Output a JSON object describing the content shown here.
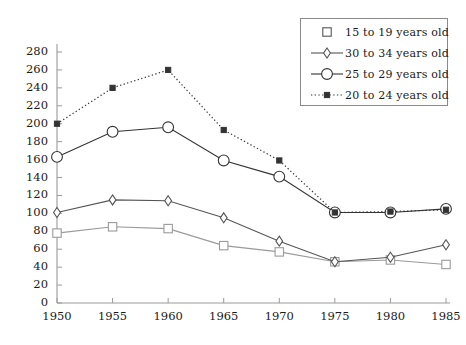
{
  "chart_data": {
    "type": "line",
    "title": "",
    "xlabel": "",
    "ylabel": "",
    "x": [
      1950,
      1955,
      1960,
      1965,
      1970,
      1975,
      1980,
      1985
    ],
    "xtick_labels": [
      "1950",
      "1955",
      "1960",
      "1965",
      "1970",
      "1975",
      "1980",
      "1985"
    ],
    "ytick_labels": [
      "0",
      "20",
      "40",
      "60",
      "80",
      "100",
      "120",
      "140",
      "160",
      "180",
      "200",
      "220",
      "240",
      "260",
      "280"
    ],
    "ytick_values": [
      0,
      20,
      40,
      60,
      80,
      100,
      120,
      140,
      160,
      180,
      200,
      220,
      240,
      260,
      280
    ],
    "xlim": [
      1948.5,
      1986.5
    ],
    "ylim": [
      0,
      288
    ],
    "grid": false,
    "legend_position": "top-right",
    "series": [
      {
        "name": "15 to 19 years old",
        "marker": "square",
        "linestyle": "solid",
        "color": "#9a9a9a",
        "values": [
          78,
          85,
          83,
          64,
          57,
          46,
          48,
          43
        ]
      },
      {
        "name": "30 to 34 years old",
        "marker": "diamond",
        "linestyle": "solid",
        "color": "#555555",
        "values": [
          101,
          115,
          114,
          95,
          69,
          46,
          51,
          65
        ]
      },
      {
        "name": "25 to 29 years old",
        "marker": "circle",
        "linestyle": "solid",
        "color": "#333333",
        "values": [
          163,
          191,
          196,
          159,
          141,
          101,
          101,
          105
        ]
      },
      {
        "name": "20 to 24 years old",
        "marker": "small-square",
        "linestyle": "dotted",
        "color": "#333333",
        "values": [
          200,
          240,
          260,
          193,
          159,
          101,
          102,
          104
        ]
      }
    ]
  },
  "legend": {
    "entries": [
      {
        "label": "15 to 19 years old",
        "marker": "square",
        "linestyle": "none"
      },
      {
        "label": "30 to 34 years old",
        "marker": "diamond",
        "linestyle": "solid"
      },
      {
        "label": "25 to 29 years old",
        "marker": "circle",
        "linestyle": "solid"
      },
      {
        "label": "20 to 24 years old",
        "marker": "small-square",
        "linestyle": "dotted"
      }
    ]
  },
  "axis": {
    "left_color": "#9a9a9a",
    "bottom_color": "#9a9a9a"
  }
}
